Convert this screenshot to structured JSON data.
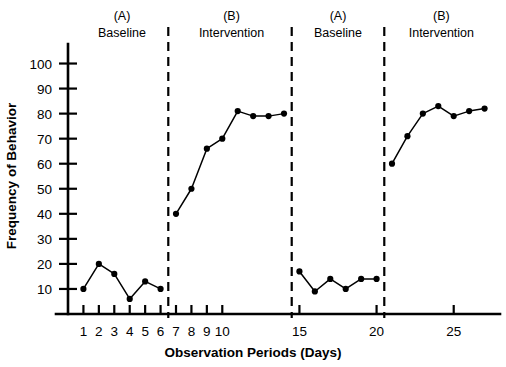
{
  "chart_data": {
    "type": "line",
    "title": "",
    "xlabel": "Observation Periods (Days)",
    "ylabel": "Frequency of Behavior",
    "xlim": [
      0,
      28
    ],
    "ylim": [
      0,
      105
    ],
    "grid": false,
    "legend": "none",
    "ytick_labels": [
      "10",
      "20",
      "30",
      "40",
      "50",
      "60",
      "70",
      "80",
      "90",
      "100"
    ],
    "yticks": [
      10,
      20,
      30,
      40,
      50,
      60,
      70,
      80,
      90,
      100
    ],
    "xtick_labels": [
      "1",
      "2",
      "3",
      "4",
      "5",
      "6",
      "7",
      "8",
      "9",
      "10",
      "15",
      "20",
      "25"
    ],
    "xticks": [
      1,
      2,
      3,
      4,
      5,
      6,
      7,
      8,
      9,
      10,
      15,
      20,
      25
    ],
    "xticks_minor": [
      11,
      12,
      13,
      14,
      16,
      17,
      18,
      19,
      21,
      22,
      23,
      24,
      26,
      27
    ],
    "phase_dividers": [
      6.5,
      14.5,
      20.5
    ],
    "phase_headers": [
      {
        "letter": "(A)",
        "name": "Baseline",
        "x": 3.5
      },
      {
        "letter": "(B)",
        "name": "Intervention",
        "x": 10.6
      },
      {
        "letter": "(A)",
        "name": "Baseline",
        "x": 17.5
      },
      {
        "letter": "(B)",
        "name": "Intervention",
        "x": 24.2
      }
    ],
    "series": [
      {
        "name": "Baseline A1",
        "x": [
          1,
          2,
          3,
          4,
          5,
          6
        ],
        "values": [
          10,
          20,
          16,
          6,
          13,
          10
        ]
      },
      {
        "name": "Intervention B1",
        "x": [
          7,
          8,
          9,
          10,
          11,
          12,
          13,
          14
        ],
        "values": [
          40,
          50,
          66,
          70,
          81,
          79,
          79,
          80
        ]
      },
      {
        "name": "Baseline A2",
        "x": [
          15,
          16,
          17,
          18,
          19,
          20
        ],
        "values": [
          17,
          9,
          14,
          10,
          14,
          14
        ]
      },
      {
        "name": "Intervention B2",
        "x": [
          21,
          22,
          23,
          24,
          25,
          26,
          27
        ],
        "values": [
          60,
          71,
          80,
          83,
          79,
          81,
          82
        ]
      }
    ]
  }
}
